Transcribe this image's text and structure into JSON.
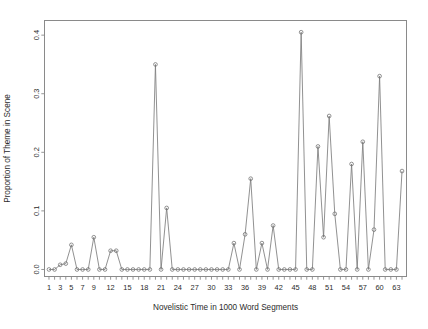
{
  "chart_data": {
    "type": "line",
    "title": "",
    "xlabel": "Novelistic Time in 1000 Word Segments",
    "ylabel": "Proportion of Theme in Scene",
    "xlim": [
      0.2,
      64.8
    ],
    "ylim": [
      -0.012,
      0.425
    ],
    "grid": false,
    "legend": null,
    "marker": "open-circle",
    "x_tick_labels": [
      "1",
      "3",
      "5",
      "7",
      "9",
      "12",
      "15",
      "18",
      "21",
      "24",
      "27",
      "30",
      "33",
      "36",
      "39",
      "42",
      "45",
      "48",
      "51",
      "54",
      "57",
      "60",
      "63"
    ],
    "x_tick_values": [
      1,
      3,
      5,
      7,
      9,
      12,
      15,
      18,
      21,
      24,
      27,
      30,
      33,
      36,
      39,
      42,
      45,
      48,
      51,
      54,
      57,
      60,
      63
    ],
    "x_minor_ticks": [
      1,
      2,
      3,
      4,
      5,
      6,
      7,
      8,
      9,
      10,
      11,
      12,
      13,
      14,
      15,
      16,
      17,
      18,
      19,
      20,
      21,
      22,
      23,
      24,
      25,
      26,
      27,
      28,
      29,
      30,
      31,
      32,
      33,
      34,
      35,
      36,
      37,
      38,
      39,
      40,
      41,
      42,
      43,
      44,
      45,
      46,
      47,
      48,
      49,
      50,
      51,
      52,
      53,
      54,
      55,
      56,
      57,
      58,
      59,
      60,
      61,
      62,
      63,
      64
    ],
    "y_tick_labels": [
      "0.0",
      "0.1",
      "0.2",
      "0.3",
      "0.4"
    ],
    "y_tick_values": [
      0.0,
      0.1,
      0.2,
      0.3,
      0.4
    ],
    "x": [
      1,
      2,
      3,
      4,
      5,
      6,
      7,
      8,
      9,
      10,
      11,
      12,
      13,
      14,
      15,
      16,
      17,
      18,
      19,
      20,
      21,
      22,
      23,
      24,
      25,
      26,
      27,
      28,
      29,
      30,
      31,
      32,
      33,
      34,
      35,
      36,
      37,
      38,
      39,
      40,
      41,
      42,
      43,
      44,
      45,
      46,
      47,
      48,
      49,
      50,
      51,
      52,
      53,
      54,
      55,
      56,
      57,
      58,
      59,
      60,
      61,
      62,
      63,
      64
    ],
    "values": [
      0.0,
      0.0,
      0.008,
      0.01,
      0.042,
      0.0,
      0.0,
      0.0,
      0.055,
      0.0,
      0.0,
      0.032,
      0.032,
      0.0,
      0.0,
      0.0,
      0.0,
      0.0,
      0.0,
      0.35,
      0.0,
      0.105,
      0.0,
      0.0,
      0.0,
      0.0,
      0.0,
      0.0,
      0.0,
      0.0,
      0.0,
      0.0,
      0.0,
      0.045,
      0.0,
      0.06,
      0.155,
      0.0,
      0.045,
      0.0,
      0.075,
      0.0,
      0.0,
      0.0,
      0.0,
      0.405,
      0.0,
      0.0,
      0.21,
      0.055,
      0.262,
      0.095,
      0.0,
      0.0,
      0.18,
      0.0,
      0.218,
      0.0,
      0.068,
      0.33,
      0.0,
      0.0,
      0.0,
      0.168
    ],
    "line_color": "#7d7d7d",
    "axis_color": "#8a8a8a",
    "background_color": "#ffffff"
  }
}
